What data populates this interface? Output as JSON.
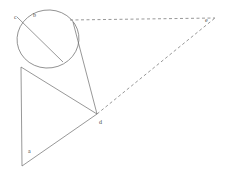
{
  "diagram": {
    "type": "geometry-figure",
    "width": 238,
    "height": 172,
    "background_color": "#ffffff",
    "stroke_color": "#6b6b6b",
    "stroke_width": 0.7,
    "label_color": "#4a4a4a",
    "label_font_size": 6,
    "points": {
      "a": {
        "label": "a",
        "x": 22,
        "y": 166,
        "label_x": 28,
        "label_y": 148
      },
      "b": {
        "label": "b",
        "x": 39,
        "y": 20,
        "label_x": 33,
        "label_y": 12
      },
      "c": {
        "label": "c",
        "x": 17,
        "y": 17,
        "label_x": 14,
        "label_y": 14
      },
      "d": {
        "label": "d",
        "x": 97,
        "y": 114,
        "label_x": 99,
        "label_y": 119
      },
      "e": {
        "label": "e",
        "x": 215,
        "y": 18,
        "label_x": 205,
        "label_y": 17
      }
    },
    "circle": {
      "name": "main-circle",
      "cx": 48,
      "cy": 39,
      "rx": 31,
      "ry": 29,
      "rotation": -8
    },
    "solid_segments": [
      {
        "name": "chord-c-to-circle",
        "x1": 17,
        "y1": 17,
        "x2": 63,
        "y2": 62
      },
      {
        "name": "tangent-top-to-d",
        "x1": 73,
        "y1": 22,
        "x2": 97,
        "y2": 114
      },
      {
        "name": "tangent-left-to-d",
        "x1": 21,
        "y1": 67,
        "x2": 97,
        "y2": 114
      },
      {
        "name": "segment-d-to-a",
        "x1": 97,
        "y1": 114,
        "x2": 22,
        "y2": 166
      },
      {
        "name": "vertical-left-edge",
        "x1": 21,
        "y1": 67,
        "x2": 22,
        "y2": 166
      }
    ],
    "dashed_segments": [
      {
        "name": "horizontal-dashed-to-e",
        "x1": 70,
        "y1": 20,
        "x2": 215,
        "y2": 18
      },
      {
        "name": "diagonal-dashed-d-to-e",
        "x1": 97,
        "y1": 114,
        "x2": 215,
        "y2": 18
      }
    ],
    "dash_pattern": "3,2.5"
  }
}
